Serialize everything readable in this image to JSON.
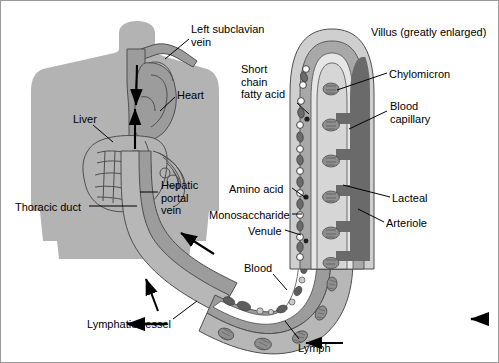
{
  "figure": {
    "background_color": "#ffffff",
    "border_color": "#9a9a9a",
    "width": 499,
    "height": 363
  },
  "palette": {
    "body_silhouette": "#b3b3b3",
    "vessel_mid_gray": "#9c9c9c",
    "vessel_dark_gray": "#6e6e6e",
    "villus_outer": "#cfcfcf",
    "villus_band": "#a8a8a8",
    "villus_inner_light": "#e6e6e6",
    "capillary_dark": "#6a6a6a",
    "lacteal_light": "#d6d6d6",
    "outline": "#4a4a4a",
    "text": "#000000",
    "arrow": "#000000",
    "white": "#ffffff"
  },
  "labels": [
    {
      "id": "left-subclavian-vein",
      "text": "Left subclavian\nvein",
      "x": 190,
      "y": 22,
      "align": "left"
    },
    {
      "id": "heart",
      "text": "Heart",
      "x": 176,
      "y": 88,
      "align": "left"
    },
    {
      "id": "liver",
      "text": "Liver",
      "x": 72,
      "y": 112,
      "align": "left"
    },
    {
      "id": "hepatic-portal-vein",
      "text": "Hepatic\nportal\nvein",
      "x": 160,
      "y": 178,
      "align": "left"
    },
    {
      "id": "thoracic-duct",
      "text": "Thoracic duct",
      "x": 14,
      "y": 200,
      "align": "left"
    },
    {
      "id": "lymphatic-vessel",
      "text": "Lymphatic vessel",
      "x": 86,
      "y": 317,
      "align": "left"
    },
    {
      "id": "short-chain-fatty-acid",
      "text": "Short\nchain\nfatty acid",
      "x": 240,
      "y": 62,
      "align": "left"
    },
    {
      "id": "amino-acid",
      "text": "Amino acid",
      "x": 228,
      "y": 182,
      "align": "left"
    },
    {
      "id": "monosaccharide",
      "text": "Monosaccharide",
      "x": 208,
      "y": 208,
      "align": "left"
    },
    {
      "id": "venule",
      "text": "Venule",
      "x": 247,
      "y": 224,
      "align": "left"
    },
    {
      "id": "blood",
      "text": "Blood",
      "x": 243,
      "y": 261,
      "align": "left"
    },
    {
      "id": "villus-greatly-enlarged",
      "text": "Villus (greatly enlarged)",
      "x": 370,
      "y": 25,
      "align": "left"
    },
    {
      "id": "chylomicron",
      "text": "Chylomicron",
      "x": 388,
      "y": 67,
      "align": "left"
    },
    {
      "id": "blood-capillary",
      "text": "Blood\ncapillary",
      "x": 389,
      "y": 99,
      "align": "left"
    },
    {
      "id": "lacteal",
      "text": "Lacteal",
      "x": 391,
      "y": 191,
      "align": "left"
    },
    {
      "id": "arteriole",
      "text": "Arteriole",
      "x": 385,
      "y": 216,
      "align": "left"
    },
    {
      "id": "lymph",
      "text": "Lymph",
      "x": 297,
      "y": 341,
      "align": "left"
    }
  ],
  "leader_lines": [
    {
      "id": "leader-left-subclavian-vein",
      "from": [
        188,
        38
      ],
      "to": [
        163,
        57
      ]
    },
    {
      "id": "leader-heart",
      "from": [
        174,
        96
      ],
      "to": [
        159,
        110
      ]
    },
    {
      "id": "leader-liver",
      "from": [
        92,
        124
      ],
      "to": [
        110,
        140
      ]
    },
    {
      "id": "leader-hepatic-portal-vein",
      "from": [
        158,
        191
      ],
      "to": [
        141,
        191
      ]
    },
    {
      "id": "leader-thoracic-duct",
      "from": [
        86,
        205
      ],
      "to": [
        133,
        205
      ]
    },
    {
      "id": "leader-lymphatic-vessel",
      "from": [
        172,
        318
      ],
      "to": [
        194,
        300
      ]
    },
    {
      "id": "leader-short-chain-fatty-acid",
      "from": [
        296,
        102
      ],
      "to": [
        313,
        114
      ]
    },
    {
      "id": "leader-amino-acid",
      "from": [
        289,
        187
      ],
      "to": [
        307,
        199
      ]
    },
    {
      "id": "leader-monosaccharide",
      "from": [
        291,
        213
      ],
      "to": [
        312,
        213
      ]
    },
    {
      "id": "leader-venule",
      "from": [
        283,
        229
      ],
      "to": [
        311,
        232
      ]
    },
    {
      "id": "leader-blood",
      "from": [
        272,
        273
      ],
      "to": [
        287,
        288
      ]
    },
    {
      "id": "leader-chylomicron",
      "from": [
        386,
        72
      ],
      "to": [
        335,
        88
      ]
    },
    {
      "id": "leader-blood-capillary",
      "from": [
        386,
        110
      ],
      "to": [
        347,
        127
      ]
    },
    {
      "id": "leader-lacteal",
      "from": [
        389,
        196
      ],
      "to": [
        340,
        183
      ]
    },
    {
      "id": "leader-arteriole",
      "from": [
        383,
        221
      ],
      "to": [
        356,
        207
      ]
    },
    {
      "id": "leader-lymph",
      "from": [
        298,
        338
      ],
      "to": [
        283,
        320
      ]
    }
  ],
  "flow_arrows": [
    {
      "id": "arrow-thoracic-duct-up",
      "desc": "upward arrow in thoracic duct toward subclavian vein"
    },
    {
      "id": "arrow-portal-vein-up",
      "desc": "upward arrow in hepatic portal vein toward liver"
    },
    {
      "id": "arrow-down-descending",
      "desc": "downward arrow along vena cava"
    },
    {
      "id": "arrow-blood-to-portal",
      "desc": "arrow pointing up-left from gut blood vessel into hepatic portal vein"
    },
    {
      "id": "arrow-lymph-to-duct",
      "desc": "arrow pointing up-left along lymphatic vessel"
    },
    {
      "id": "arrow-lymph-flow-left",
      "desc": "leftward arrow showing lymph flow direction"
    },
    {
      "id": "arrow-lymph-flow-left-2",
      "desc": "leftward arrow at bottom of lymph vessel"
    }
  ],
  "structures": {
    "body": "human torso silhouette, head and shoulders, gray",
    "villus": "finger-shaped villus in cross-section, greatly enlarged, showing nested layers",
    "villus_layers": [
      "epithelium outer",
      "lacteal (light, central)",
      "blood capillary network (dark gray)"
    ],
    "particles": {
      "chylomicron": "large oval hatched bodies inside the lacteal",
      "short_chain_fatty_acid": "small dark dots in epithelium",
      "amino_acid": "small dark dots",
      "monosaccharide": "small open circles",
      "blood_cells": "small ovals and circles inside blood vessel"
    }
  }
}
